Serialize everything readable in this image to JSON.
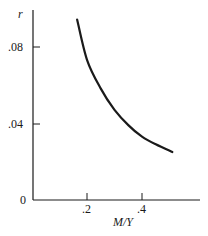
{
  "chart_data": {
    "type": "line",
    "title": "",
    "xlabel": "M/Y",
    "ylabel": "r",
    "xlim": [
      0,
      0.6
    ],
    "ylim": [
      0,
      0.1
    ],
    "x_ticks": [
      ".2",
      ".4"
    ],
    "y_ticks": [
      "0",
      ".04",
      ".08"
    ],
    "grid": false,
    "legend": null,
    "series": [
      {
        "name": "money demand curve",
        "x": [
          0.164,
          0.2,
          0.25,
          0.3,
          0.35,
          0.4,
          0.45,
          0.51
        ],
        "y": [
          0.094,
          0.073,
          0.058,
          0.047,
          0.039,
          0.033,
          0.029,
          0.025
        ]
      }
    ]
  },
  "labels": {
    "y_axis": "r",
    "x_axis": "M/Y",
    "origin": "0",
    "y_tick_04": ".04",
    "y_tick_08": ".08",
    "x_tick_2": ".2",
    "x_tick_4": ".4"
  },
  "colors": {
    "ink": "#1a1a1a",
    "background": "#ffffff"
  }
}
